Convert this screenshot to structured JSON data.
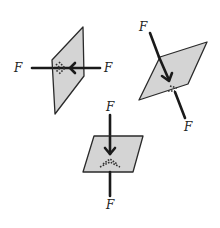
{
  "diagram": {
    "panels": [
      {
        "id": "left",
        "orientation": "vertical plane, horizontal forces",
        "labels": {
          "left": "F",
          "right": "F"
        }
      },
      {
        "id": "top-right",
        "orientation": "tilted plane, oblique forces",
        "labels": {
          "top": "F",
          "bottom": "F"
        }
      },
      {
        "id": "bottom",
        "orientation": "horizontal plane, vertical forces",
        "labels": {
          "top": "F",
          "bottom": "F"
        }
      }
    ],
    "colors": {
      "plane_fill": "#d4d4d4",
      "line": "#1a1a1a",
      "background": "#ffffff"
    }
  }
}
